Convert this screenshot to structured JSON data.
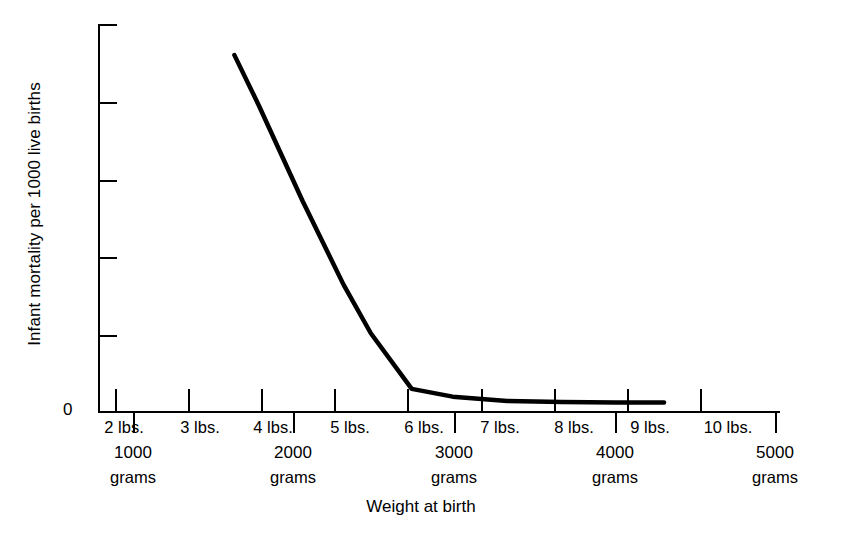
{
  "chart_data": {
    "type": "line",
    "title": "",
    "xlabel": "Weight at birth",
    "ylabel": "Infant mortality per 1000 live births",
    "ylim": [
      0,
      1000
    ],
    "xlim_grams": [
      0,
      5000
    ],
    "grid": false,
    "legend": null,
    "y_ticks": [
      0,
      200,
      400,
      600,
      800,
      1000
    ],
    "x_ticks_lbs": [
      "2 lbs.",
      "3 lbs.",
      "4 lbs.",
      "5 lbs.",
      "6 lbs.",
      "7 lbs.",
      "8 lbs.",
      "9 lbs.",
      "10 lbs."
    ],
    "x_ticks_lbs_grams": [
      907,
      1361,
      1814,
      2268,
      2722,
      3175,
      3629,
      4082,
      4536
    ],
    "x_ticks_grams_num": [
      "1000",
      "2000",
      "3000",
      "4000",
      "5000"
    ],
    "x_ticks_grams_word": "grams",
    "x_ticks_grams_values": [
      1000,
      2000,
      3000,
      4000,
      5000
    ],
    "x": [
      1000,
      1180,
      1500,
      1800,
      2000,
      2300,
      2600,
      3000,
      3400,
      3800,
      4150
    ],
    "y": [
      920,
      790,
      545,
      330,
      205,
      62,
      42,
      31,
      28,
      27,
      27
    ],
    "line_color": "#000000",
    "line_width": 4.5
  },
  "axes": {
    "y_title": "Infant mortality per 1000 live births",
    "x_title": "Weight at birth",
    "zero_label": "0"
  }
}
